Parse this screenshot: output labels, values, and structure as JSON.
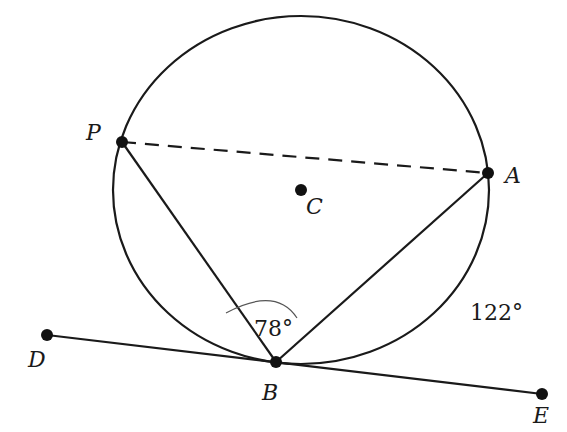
{
  "diagram": {
    "circle": {
      "center_label": "C",
      "cx": 301,
      "cy": 190,
      "rx": 188,
      "ry": 174
    },
    "points": [
      {
        "id": "P",
        "label": "P",
        "x": 122,
        "y": 142,
        "lx": 86,
        "ly": 140
      },
      {
        "id": "A",
        "label": "A",
        "x": 488,
        "y": 173,
        "lx": 505,
        "ly": 183
      },
      {
        "id": "C",
        "label": "C",
        "x": 301,
        "y": 190,
        "lx": 306,
        "ly": 214
      },
      {
        "id": "B",
        "label": "B",
        "x": 276,
        "y": 362,
        "lx": 262,
        "ly": 400
      },
      {
        "id": "D",
        "label": "D",
        "x": 47,
        "y": 335,
        "lx": 28,
        "ly": 367
      },
      {
        "id": "E",
        "label": "E",
        "x": 542,
        "y": 394,
        "lx": 533,
        "ly": 423
      }
    ],
    "segments": [
      {
        "from": "P",
        "to": "A",
        "style": "dashed"
      },
      {
        "from": "P",
        "to": "B",
        "style": "solid"
      },
      {
        "from": "A",
        "to": "B",
        "style": "solid"
      },
      {
        "from": "D",
        "to": "E",
        "style": "solid",
        "note": "tangent at B"
      }
    ],
    "angle_PBA": {
      "label": "78°",
      "x": 254,
      "y": 336
    },
    "arc_AB": {
      "label": "122°",
      "x": 470,
      "y": 320
    }
  }
}
